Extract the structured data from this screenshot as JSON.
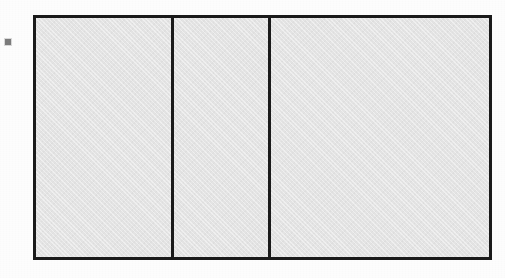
{
  "document": {
    "kind": "scanned-line-drawing",
    "background_color": "#fdfdfd",
    "panel_fill_color": "#e4e4e4",
    "ink_color": "#1b1b1b",
    "mark_color": "#7c7c7c"
  },
  "margin_mark": {
    "name": "ink-speck",
    "label": ""
  },
  "frame": {
    "name": "outlined-rectangle",
    "border_width_px": 3,
    "panel_count": 3,
    "panels": [
      {
        "id": "panel-1",
        "label": "",
        "width_px": 135
      },
      {
        "id": "panel-2",
        "label": "",
        "width_px": 97
      },
      {
        "id": "panel-3",
        "label": "",
        "width_px": 221
      }
    ]
  }
}
